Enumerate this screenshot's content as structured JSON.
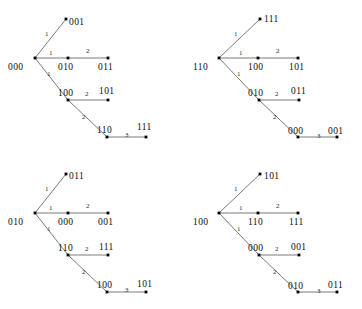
{
  "figure": {
    "type": "diagram",
    "panel_count": 4,
    "stroke_color": "#6b6b6b",
    "node_color": "#000000",
    "background": "#ffffff"
  },
  "panels": [
    {
      "id": "panel-top-left",
      "root": "000",
      "nodes": [
        {
          "id": "root",
          "label": "000",
          "x": 35,
          "y": 58,
          "label_x": 8,
          "label_y": 62,
          "anchor": "below-left"
        },
        {
          "id": "n1",
          "label": "001",
          "x": 66,
          "y": 19,
          "label_x": 69,
          "label_y": 17,
          "anchor": "right"
        },
        {
          "id": "n2",
          "label": "010",
          "x": 68,
          "y": 58,
          "label_x": 58,
          "label_y": 62,
          "anchor": "below"
        },
        {
          "id": "n3",
          "label": "011",
          "x": 108,
          "y": 58,
          "label_x": 98,
          "label_y": 62,
          "anchor": "below"
        },
        {
          "id": "n4",
          "label": "100",
          "x": 68,
          "y": 100,
          "label_x": 58,
          "label_y": 88,
          "anchor": "above"
        },
        {
          "id": "n5",
          "label": "101",
          "x": 108,
          "y": 100,
          "label_x": 99,
          "label_y": 86,
          "anchor": "above"
        },
        {
          "id": "n6",
          "label": "110",
          "x": 107,
          "y": 137,
          "label_x": 97,
          "label_y": 125,
          "anchor": "above"
        },
        {
          "id": "n7",
          "label": "111",
          "x": 146,
          "y": 137,
          "label_x": 137,
          "label_y": 122,
          "anchor": "above"
        }
      ],
      "edges": [
        {
          "from": "root",
          "to": "n1",
          "weight": "1",
          "label_x": 45,
          "label_y": 30
        },
        {
          "from": "root",
          "to": "n2",
          "weight": "1",
          "label_x": 49,
          "label_y": 49
        },
        {
          "from": "n2",
          "to": "n3",
          "weight": "2",
          "label_x": 86,
          "label_y": 47
        },
        {
          "from": "root",
          "to": "n4",
          "weight": "1",
          "label_x": 47,
          "label_y": 70
        },
        {
          "from": "n4",
          "to": "n5",
          "weight": "2",
          "label_x": 85,
          "label_y": 90
        },
        {
          "from": "n4",
          "to": "n6",
          "weight": "2",
          "label_x": 82,
          "label_y": 113
        },
        {
          "from": "n6",
          "to": "n7",
          "weight": "3",
          "label_x": 125,
          "label_y": 131
        }
      ]
    },
    {
      "id": "panel-top-right",
      "root": "110",
      "nodes": [
        {
          "id": "root",
          "label": "110",
          "x": 38,
          "y": 58,
          "label_x": 12,
          "label_y": 62,
          "anchor": "below-left"
        },
        {
          "id": "n1",
          "label": "111",
          "x": 79,
          "y": 19,
          "label_x": 83,
          "label_y": 14,
          "anchor": "right"
        },
        {
          "id": "n2",
          "label": "100",
          "x": 77,
          "y": 58,
          "label_x": 67,
          "label_y": 62,
          "anchor": "below"
        },
        {
          "id": "n3",
          "label": "101",
          "x": 117,
          "y": 58,
          "label_x": 108,
          "label_y": 62,
          "anchor": "below"
        },
        {
          "id": "n4",
          "label": "010",
          "x": 78,
          "y": 100,
          "label_x": 67,
          "label_y": 88,
          "anchor": "above"
        },
        {
          "id": "n5",
          "label": "011",
          "x": 118,
          "y": 100,
          "label_x": 110,
          "label_y": 86,
          "anchor": "above"
        },
        {
          "id": "n6",
          "label": "000",
          "x": 117,
          "y": 137,
          "label_x": 107,
          "label_y": 126,
          "anchor": "above"
        },
        {
          "id": "n7",
          "label": "001",
          "x": 156,
          "y": 137,
          "label_x": 147,
          "label_y": 126,
          "anchor": "above"
        }
      ],
      "edges": [
        {
          "from": "root",
          "to": "n1",
          "weight": "1",
          "label_x": 53,
          "label_y": 30
        },
        {
          "from": "root",
          "to": "n2",
          "weight": "1",
          "label_x": 58,
          "label_y": 49
        },
        {
          "from": "n2",
          "to": "n3",
          "weight": "2",
          "label_x": 95,
          "label_y": 47
        },
        {
          "from": "root",
          "to": "n4",
          "weight": "1",
          "label_x": 56,
          "label_y": 70
        },
        {
          "from": "n4",
          "to": "n5",
          "weight": "2",
          "label_x": 94,
          "label_y": 90
        },
        {
          "from": "n4",
          "to": "n6",
          "weight": "2",
          "label_x": 92,
          "label_y": 113
        },
        {
          "from": "n6",
          "to": "n7",
          "weight": "3",
          "label_x": 136,
          "label_y": 132
        }
      ]
    },
    {
      "id": "panel-bottom-left",
      "root": "010",
      "nodes": [
        {
          "id": "root",
          "label": "010",
          "x": 35,
          "y": 58,
          "label_x": 8,
          "label_y": 62,
          "anchor": "below-left"
        },
        {
          "id": "n1",
          "label": "011",
          "x": 66,
          "y": 19,
          "label_x": 69,
          "label_y": 16,
          "anchor": "right"
        },
        {
          "id": "n2",
          "label": "000",
          "x": 68,
          "y": 58,
          "label_x": 58,
          "label_y": 62,
          "anchor": "below"
        },
        {
          "id": "n3",
          "label": "001",
          "x": 108,
          "y": 58,
          "label_x": 98,
          "label_y": 62,
          "anchor": "below"
        },
        {
          "id": "n4",
          "label": "110",
          "x": 68,
          "y": 100,
          "label_x": 58,
          "label_y": 88,
          "anchor": "above"
        },
        {
          "id": "n5",
          "label": "111",
          "x": 108,
          "y": 100,
          "label_x": 99,
          "label_y": 87,
          "anchor": "above"
        },
        {
          "id": "n6",
          "label": "100",
          "x": 107,
          "y": 137,
          "label_x": 97,
          "label_y": 125,
          "anchor": "above"
        },
        {
          "id": "n7",
          "label": "101",
          "x": 146,
          "y": 137,
          "label_x": 137,
          "label_y": 124,
          "anchor": "above"
        }
      ],
      "edges": [
        {
          "from": "root",
          "to": "n1",
          "weight": "1",
          "label_x": 45,
          "label_y": 30
        },
        {
          "from": "root",
          "to": "n2",
          "weight": "1",
          "label_x": 49,
          "label_y": 49
        },
        {
          "from": "n2",
          "to": "n3",
          "weight": "2",
          "label_x": 86,
          "label_y": 47
        },
        {
          "from": "root",
          "to": "n4",
          "weight": "1",
          "label_x": 47,
          "label_y": 70
        },
        {
          "from": "n4",
          "to": "n5",
          "weight": "2",
          "label_x": 85,
          "label_y": 90
        },
        {
          "from": "n4",
          "to": "n6",
          "weight": "2",
          "label_x": 82,
          "label_y": 113
        },
        {
          "from": "n6",
          "to": "n7",
          "weight": "3",
          "label_x": 125,
          "label_y": 131
        }
      ]
    },
    {
      "id": "panel-bottom-right",
      "root": "100",
      "nodes": [
        {
          "id": "root",
          "label": "100",
          "x": 38,
          "y": 58,
          "label_x": 12,
          "label_y": 62,
          "anchor": "below-left"
        },
        {
          "id": "n1",
          "label": "101",
          "x": 79,
          "y": 19,
          "label_x": 83,
          "label_y": 16,
          "anchor": "right"
        },
        {
          "id": "n2",
          "label": "110",
          "x": 77,
          "y": 58,
          "label_x": 67,
          "label_y": 62,
          "anchor": "below"
        },
        {
          "id": "n3",
          "label": "111",
          "x": 117,
          "y": 58,
          "label_x": 108,
          "label_y": 62,
          "anchor": "below"
        },
        {
          "id": "n4",
          "label": "000",
          "x": 78,
          "y": 100,
          "label_x": 67,
          "label_y": 88,
          "anchor": "above"
        },
        {
          "id": "n5",
          "label": "001",
          "x": 118,
          "y": 100,
          "label_x": 110,
          "label_y": 87,
          "anchor": "above"
        },
        {
          "id": "n6",
          "label": "010",
          "x": 117,
          "y": 137,
          "label_x": 107,
          "label_y": 126,
          "anchor": "above"
        },
        {
          "id": "n7",
          "label": "011",
          "x": 156,
          "y": 137,
          "label_x": 147,
          "label_y": 125,
          "anchor": "above"
        }
      ],
      "edges": [
        {
          "from": "root",
          "to": "n1",
          "weight": "1",
          "label_x": 53,
          "label_y": 30
        },
        {
          "from": "root",
          "to": "n2",
          "weight": "1",
          "label_x": 58,
          "label_y": 49
        },
        {
          "from": "n2",
          "to": "n3",
          "weight": "2",
          "label_x": 95,
          "label_y": 47
        },
        {
          "from": "root",
          "to": "n4",
          "weight": "1",
          "label_x": 56,
          "label_y": 70
        },
        {
          "from": "n4",
          "to": "n5",
          "weight": "2",
          "label_x": 94,
          "label_y": 90
        },
        {
          "from": "n4",
          "to": "n6",
          "weight": "2",
          "label_x": 92,
          "label_y": 113
        },
        {
          "from": "n6",
          "to": "n7",
          "weight": "3",
          "label_x": 136,
          "label_y": 132
        }
      ]
    }
  ],
  "panel_positions": [
    {
      "left": 0,
      "top": 0
    },
    {
      "left": 181,
      "top": 0
    },
    {
      "left": 0,
      "top": 155
    },
    {
      "left": 181,
      "top": 155
    }
  ]
}
